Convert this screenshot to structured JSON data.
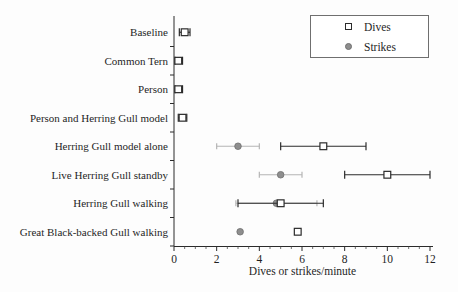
{
  "chart_data": {
    "type": "scatter",
    "orientation": "horizontal-categories",
    "title": "",
    "xlabel": "Dives or strikes/minute",
    "xlim": [
      0,
      12
    ],
    "xticks": [
      0,
      2,
      4,
      6,
      8,
      10,
      12
    ],
    "x_minor_tick_step": 0.5,
    "grid": false,
    "legend_position": "top-right",
    "categories": [
      "Baseline",
      "Common Tern",
      "Person",
      "Person and Herring Gull model",
      "Herring Gull model alone",
      "Live Herring Gull standby",
      "Herring Gull walking",
      "Great Black-backed Gull walking"
    ],
    "series": [
      {
        "name": "Dives",
        "marker": "open-square",
        "color": "#2b2b2b",
        "values": [
          0.5,
          0.2,
          0.2,
          0.4,
          7.0,
          10.0,
          5.0,
          5.8
        ],
        "err_low": [
          0.25,
          0.05,
          0.05,
          0.2,
          5.0,
          8.0,
          3.0,
          null
        ],
        "err_high": [
          0.75,
          0.4,
          0.4,
          0.6,
          9.0,
          12.0,
          7.0,
          null
        ]
      },
      {
        "name": "Strikes",
        "marker": "filled-circle",
        "color": "#8e8e8e",
        "bar_color": "#b5b5b5",
        "values": [
          null,
          null,
          null,
          null,
          3.0,
          5.0,
          4.8,
          3.1
        ],
        "err_low": [
          null,
          null,
          null,
          null,
          2.0,
          4.0,
          2.9,
          null
        ],
        "err_high": [
          null,
          null,
          null,
          null,
          4.0,
          6.0,
          6.7,
          null
        ]
      }
    ],
    "colors": {
      "axis": "#2b2b2b",
      "text": "#1f1f1f",
      "dives": "#2b2b2b",
      "strikes_marker": "#8e8e8e",
      "strikes_bar": "#b5b5b5"
    }
  }
}
